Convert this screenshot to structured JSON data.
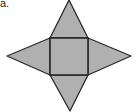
{
  "figure": {
    "label": "a.",
    "fill_color": "#b0b0b0",
    "stroke_color": "#2a2a2a",
    "shapes": {
      "square": {
        "x": 50,
        "y": 38,
        "width": 38,
        "height": 37
      },
      "triangle_top": {
        "points": "50,38 69,0 88,38"
      },
      "triangle_left": {
        "points": "50,38 7,56 50,75"
      },
      "triangle_right": {
        "points": "88,38 131,56 88,75"
      },
      "triangle_bottom": {
        "points": "50,75 70,111 88,75"
      }
    }
  }
}
